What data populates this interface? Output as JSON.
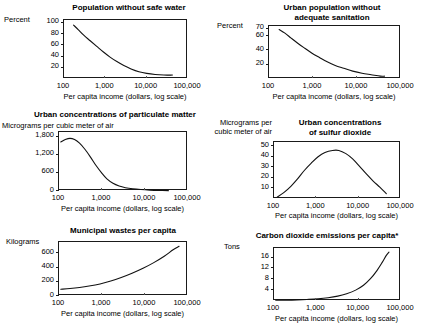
{
  "figure": {
    "background": "#ffffff",
    "ink": "#111111",
    "xaxis_title": "Per capita income (dollars, log scale)"
  },
  "chart_data": [
    {
      "id": "population-without-safe-water",
      "type": "line",
      "title": "Population without safe water",
      "ylabel": "Percent",
      "xlabel": "Per capita income (dollars, log scale)",
      "xscale": "log",
      "xlim": [
        100,
        100000
      ],
      "xticks": [
        100,
        1000,
        10000,
        100000
      ],
      "xticklabels": [
        "100",
        "1,000",
        "10,000",
        "100,000"
      ],
      "ylim": [
        0,
        105
      ],
      "yticks": [
        20,
        40,
        60,
        80,
        100
      ],
      "yticklabels": [
        "20",
        "40",
        "60",
        "80",
        "100"
      ],
      "grid": false,
      "x": [
        170,
        220,
        300,
        430,
        620,
        900,
        1300,
        1900,
        2800,
        4200,
        6500,
        10000,
        16000,
        26000,
        42000
      ],
      "y": [
        96,
        88,
        78,
        68,
        58,
        48,
        39,
        31,
        24,
        18,
        13,
        10,
        8,
        7,
        7
      ]
    },
    {
      "id": "urban-population-without-adequate-sanitation",
      "type": "line",
      "title": "Urban population without adequate sanitation",
      "ylabel": "Percent",
      "xlabel": "Per capita income (dollars, log scale)",
      "xscale": "log",
      "xlim": [
        100,
        100000
      ],
      "xticks": [
        100,
        1000,
        10000,
        100000
      ],
      "xticklabels": [
        "100",
        "1,000",
        "10,000",
        "100,000"
      ],
      "ylim": [
        0,
        74
      ],
      "yticks": [
        20,
        40,
        60,
        70
      ],
      "yticklabels": [
        "20",
        "40",
        "60",
        "70"
      ],
      "grid": false,
      "x": [
        170,
        230,
        320,
        450,
        650,
        950,
        1400,
        2100,
        3200,
        5000,
        8000,
        13000,
        21000,
        34000,
        42000
      ],
      "y": [
        69,
        64,
        57,
        50,
        43,
        36,
        30,
        24,
        19,
        15,
        11,
        8,
        6,
        4,
        4
      ]
    },
    {
      "id": "urban-concentrations-of-particulate-matter",
      "type": "line",
      "title": "Urban concentrations of particulate  matter",
      "ylabel": "Micrograms per cubic meter of air",
      "xlabel": "Per capita income (dollars, log scale)",
      "xscale": "log",
      "xlim": [
        100,
        100000
      ],
      "xticks": [
        100,
        1000,
        10000,
        100000
      ],
      "xticklabels": [
        "100",
        "1,000",
        "10,000",
        "100,000"
      ],
      "ylim": [
        0,
        1950
      ],
      "yticks": [
        0,
        600,
        1200,
        1800
      ],
      "yticklabels": [
        "0",
        "600",
        "1,200",
        "1,800"
      ],
      "grid": false,
      "x": [
        110,
        140,
        180,
        230,
        300,
        400,
        540,
        720,
        980,
        1300,
        1800,
        2500,
        3500,
        5200,
        8000,
        13000,
        22000,
        35000
      ],
      "y": [
        1620,
        1700,
        1740,
        1700,
        1580,
        1380,
        1120,
        850,
        600,
        400,
        255,
        165,
        110,
        72,
        48,
        30,
        18,
        12
      ]
    },
    {
      "id": "urban-concentrations-of-sulfur-dioxide",
      "type": "line",
      "title": "Urban concentrations of sulfur dioxide",
      "ylabel": "Micrograms per cubic meter of air",
      "xlabel": "Per capita income (dollars, log scale)",
      "xscale": "log",
      "xlim": [
        100,
        100000
      ],
      "xticks": [
        100,
        1000,
        10000,
        100000
      ],
      "xticklabels": [
        "100",
        "1,000",
        "10,000",
        "100,000"
      ],
      "ylim": [
        0,
        54
      ],
      "yticks": [
        10,
        20,
        30,
        40,
        50
      ],
      "yticklabels": [
        "10",
        "20",
        "30",
        "40",
        "50"
      ],
      "grid": false,
      "x": [
        120,
        170,
        250,
        360,
        520,
        760,
        1100,
        1600,
        2400,
        3400,
        5000,
        7200,
        10500,
        15000,
        22000,
        32000,
        45000
      ],
      "y": [
        2,
        6,
        12,
        19,
        27,
        34,
        40,
        44,
        46,
        46,
        43,
        38,
        31,
        24,
        17,
        11,
        5
      ]
    },
    {
      "id": "municipal-wastes-per-capita",
      "type": "line",
      "title": "Municipal wastes per capita",
      "ylabel": "Kilograms",
      "xlabel": "Per capita income (dollars, log scale)",
      "xscale": "log",
      "xlim": [
        100,
        100000
      ],
      "xticks": [
        100,
        1000,
        10000,
        100000
      ],
      "xticklabels": [
        "100",
        "1,000",
        "10,000",
        "100,000"
      ],
      "ylim": [
        0,
        760
      ],
      "yticks": [
        0,
        200,
        400,
        600
      ],
      "yticklabels": [
        "0",
        "200",
        "400",
        "600"
      ],
      "grid": false,
      "x": [
        110,
        180,
        300,
        500,
        900,
        1600,
        2800,
        5000,
        9000,
        16000,
        28000,
        45000,
        62000
      ],
      "y": [
        95,
        105,
        120,
        140,
        170,
        210,
        260,
        320,
        390,
        470,
        560,
        650,
        700
      ]
    },
    {
      "id": "carbon-dioxide-emissions-per-capita",
      "type": "line",
      "title": "Carbon dioxide emissions per capita*",
      "ylabel": "Tons",
      "xlabel": "Per capita income (dollars, log scale)",
      "xscale": "log",
      "xlim": [
        100,
        100000
      ],
      "xticks": [
        100,
        1000,
        10000,
        100000
      ],
      "xticklabels": [
        "100",
        "1,000",
        "10,000",
        "100,000"
      ],
      "ylim": [
        0,
        19.5
      ],
      "yticks": [
        4,
        8,
        12,
        16
      ],
      "yticklabels": [
        "4",
        "8",
        "12",
        "16"
      ],
      "grid": false,
      "x": [
        110,
        200,
        350,
        600,
        1100,
        1900,
        3200,
        5200,
        8500,
        13000,
        19000,
        27000,
        36000,
        45000,
        52000
      ],
      "y": [
        0.25,
        0.3,
        0.4,
        0.55,
        0.8,
        1.2,
        1.8,
        2.7,
        4.0,
        5.8,
        8.2,
        11.2,
        14.2,
        16.8,
        18.0
      ]
    }
  ],
  "panels": [
    {
      "title": "Population without safe water",
      "unit": "Percent",
      "xaxis_title": "Per capita income (dollars, log scale)"
    },
    {
      "title_line1": "Urban population without",
      "title_line2": "adequate sanitation",
      "unit": "Percent",
      "xaxis_title": "Per capita income (dollars, log scale)"
    },
    {
      "title": "Urban concentrations of particulate  matter",
      "unit": "Micrograms per cubic meter of air",
      "xaxis_title": "Per capita income (dollars, log scale)"
    },
    {
      "title_line1": "Urban concentrations",
      "title_line2": "of sulfur dioxide",
      "unit_line1": "Micrograms per",
      "unit_line2": "cubic meter of air",
      "xaxis_title": "Per capita income (dollars, log scale)"
    },
    {
      "title": "Municipal wastes per capita",
      "unit": "Kilograms",
      "xaxis_title": "Per capita income (dollars, log scale)"
    },
    {
      "title": "Carbon dioxide emissions per capita*",
      "unit": "Tons",
      "xaxis_title": "Per capita income (dollars, log scale)"
    }
  ]
}
